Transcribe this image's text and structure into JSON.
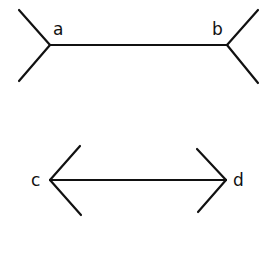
{
  "diagram": {
    "title": "",
    "stroke_color": "#111111",
    "background": "#ffffff",
    "figures": [
      {
        "id": "top",
        "description": "Line segment with outward-pointing fins (tails) at both ends",
        "labels": {
          "left": "a",
          "right": "b"
        }
      },
      {
        "id": "bottom",
        "description": "Line segment with inward-pointing arrowheads at both ends",
        "labels": {
          "left": "c",
          "right": "d"
        }
      }
    ]
  }
}
